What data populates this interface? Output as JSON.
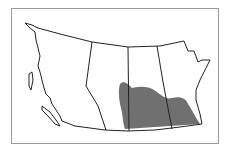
{
  "map": {
    "region": "Western Canada",
    "provinces": [
      "British Columbia",
      "Alberta",
      "Saskatchewan",
      "Manitoba"
    ],
    "shaded_area_color": "#707070",
    "border_color": "#222222",
    "frame_color": "#9a9a9a"
  }
}
